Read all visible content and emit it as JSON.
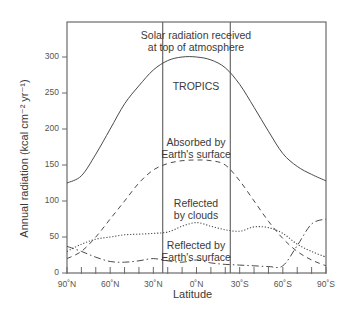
{
  "chart_data": {
    "type": "line",
    "title": "",
    "xlabel": "Latitude",
    "ylabel": "Annual radiation (kcal cm⁻² yr⁻¹)",
    "ylim": [
      0,
      320
    ],
    "xlim": [
      90,
      -90
    ],
    "yticks": [
      0,
      50,
      100,
      150,
      200,
      250,
      300
    ],
    "xtick_labels": [
      "90˚N",
      "60˚N",
      "30˚N",
      "0˚N",
      "30˚S",
      "60˚S",
      "90˚S"
    ],
    "xtick_positions": [
      90,
      60,
      30,
      0,
      -30,
      -60,
      -90
    ],
    "minor_xtick_step": 10,
    "grid": false,
    "legend": "none (curves labeled inline)",
    "vertical_lines": [
      {
        "lat": 23.5,
        "label": "Tropic of Cancer"
      },
      {
        "lat": -23.5,
        "label": "Tropic of Capricorn"
      }
    ],
    "x": [
      90,
      80,
      70,
      60,
      50,
      40,
      30,
      20,
      10,
      0,
      -10,
      -20,
      -30,
      -40,
      -50,
      -60,
      -70,
      -80,
      -90
    ],
    "series": [
      {
        "name": "Solar radiation received at top of atmosphere",
        "style": "solid",
        "values": [
          125,
          135,
          165,
          200,
          235,
          260,
          282,
          295,
          300,
          300,
          296,
          285,
          262,
          230,
          197,
          166,
          148,
          137,
          128
        ]
      },
      {
        "name": "Absorbed by Earth's surface",
        "style": "dashed",
        "values": [
          20,
          30,
          50,
          75,
          100,
          125,
          143,
          152,
          156,
          157,
          156,
          150,
          128,
          100,
          72,
          48,
          30,
          18,
          10
        ]
      },
      {
        "name": "Reflected by clouds",
        "style": "dotted",
        "values": [
          30,
          40,
          47,
          50,
          53,
          54,
          55,
          57,
          65,
          70,
          65,
          60,
          58,
          64,
          63,
          55,
          40,
          30,
          22
        ]
      },
      {
        "name": "Reflected by Earth's surface",
        "style": "dash-dot",
        "values": [
          37,
          30,
          22,
          16,
          15,
          17,
          20,
          17,
          15,
          18,
          14,
          12,
          11,
          10,
          9,
          10,
          38,
          68,
          75
        ]
      }
    ],
    "annotations": [
      {
        "text": "Solar radiation received",
        "line2": "at top of atmosphere"
      },
      {
        "text": "TROPICS"
      },
      {
        "text": "Absorbed by",
        "line2": "Earth's surface"
      },
      {
        "text": "Reflected",
        "line2": "by clouds"
      },
      {
        "text": "Reflected by",
        "line2": "Earth's surface"
      }
    ]
  },
  "labels": {
    "ylabel": "Annual radiation (kcal cm⁻² yr⁻¹)",
    "xlabel": "Latitude",
    "solar_1": "Solar radiation received",
    "solar_2": "at top of atmosphere",
    "tropics": "TROPICS",
    "absorbed_1": "Absorbed by",
    "absorbed_2": "Earth's surface",
    "clouds_1": "Reflected",
    "clouds_2": "by clouds",
    "surface_1": "Reflected by",
    "surface_2": "Earth's surface"
  },
  "colors": {
    "axis": "#6a6a6a",
    "line": "#4a4a4a",
    "text": "#3a3a3a"
  }
}
